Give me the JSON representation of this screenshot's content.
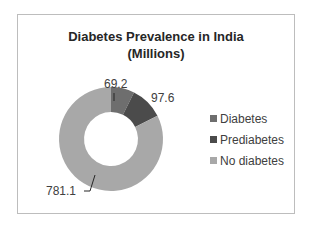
{
  "chart_data": {
    "type": "donut",
    "title": "Diabetes Prevalence in India (Millions)",
    "title_lines": [
      "Diabetes Prevalence in India",
      "(Millions)"
    ],
    "categories": [
      "Diabetes",
      "Prediabetes",
      "No diabetes"
    ],
    "values": [
      69.2,
      97.6,
      781.1
    ],
    "data_labels": [
      "69.2",
      "97.6",
      "781.1"
    ],
    "colors": [
      "#6e6e6e",
      "#4b4b4b",
      "#a8a8a8"
    ],
    "legend_position": "right",
    "unit": "Millions"
  }
}
